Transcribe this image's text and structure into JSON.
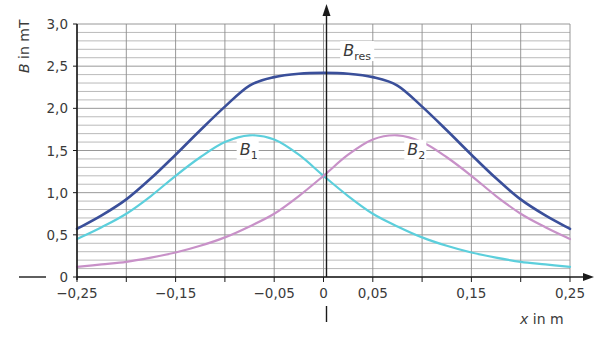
{
  "chart_data": {
    "type": "line",
    "title": "",
    "xlabel": "x in m",
    "ylabel": "B in mT",
    "xlim": [
      -0.25,
      0.25
    ],
    "ylim": [
      0,
      3.0
    ],
    "grid": true,
    "x_tick_labels": [
      "−0,25",
      "−0,15",
      "−0,05",
      "0",
      "0,05",
      "0,15",
      "0,25"
    ],
    "x_tick_values": [
      -0.25,
      -0.15,
      -0.05,
      0,
      0.05,
      0.15,
      0.25
    ],
    "y_tick_labels": [
      "0",
      "0,5",
      "1,0",
      "1,5",
      "2,0",
      "2,5",
      "3,0"
    ],
    "y_tick_values": [
      0,
      0.5,
      1.0,
      1.5,
      2.0,
      2.5,
      3.0
    ],
    "x": [
      -0.25,
      -0.225,
      -0.2,
      -0.175,
      -0.15,
      -0.125,
      -0.1,
      -0.075,
      -0.05,
      -0.025,
      0,
      0.025,
      0.05,
      0.075,
      0.1,
      0.125,
      0.15,
      0.175,
      0.2,
      0.225,
      0.25
    ],
    "series": [
      {
        "name": "B_res",
        "label_main": "B",
        "label_sub": "res",
        "color": "#3a4f9a",
        "values": [
          0.57,
          0.73,
          0.92,
          1.17,
          1.45,
          1.74,
          2.02,
          2.27,
          2.37,
          2.41,
          2.42,
          2.41,
          2.37,
          2.27,
          2.02,
          1.74,
          1.45,
          1.17,
          0.92,
          0.73,
          0.57
        ]
      },
      {
        "name": "B_1",
        "label_main": "B",
        "label_sub": "1",
        "color": "#5ccfdc",
        "values": [
          0.45,
          0.59,
          0.75,
          0.96,
          1.2,
          1.42,
          1.6,
          1.68,
          1.63,
          1.45,
          1.2,
          0.96,
          0.75,
          0.6,
          0.47,
          0.37,
          0.29,
          0.23,
          0.18,
          0.15,
          0.12
        ]
      },
      {
        "name": "B_2",
        "label_main": "B",
        "label_sub": "2",
        "color": "#c891c8",
        "values": [
          0.12,
          0.15,
          0.18,
          0.23,
          0.29,
          0.37,
          0.47,
          0.6,
          0.75,
          0.96,
          1.2,
          1.45,
          1.63,
          1.68,
          1.6,
          1.42,
          1.2,
          0.96,
          0.75,
          0.59,
          0.45
        ]
      }
    ],
    "annotations": [
      {
        "text": "B_res",
        "x": 0.02,
        "y": 2.62
      },
      {
        "text": "B_1",
        "x": -0.085,
        "y": 1.45
      },
      {
        "text": "B_2",
        "x": 0.085,
        "y": 1.45
      }
    ]
  },
  "labels": {
    "y_axis_main": "B",
    "y_axis_rest": " in mT",
    "x_axis_main": "x",
    "x_axis_rest": " in m"
  },
  "style": {
    "grid_color": "#8c8c8c",
    "axis_color": "#1a1a1a"
  }
}
